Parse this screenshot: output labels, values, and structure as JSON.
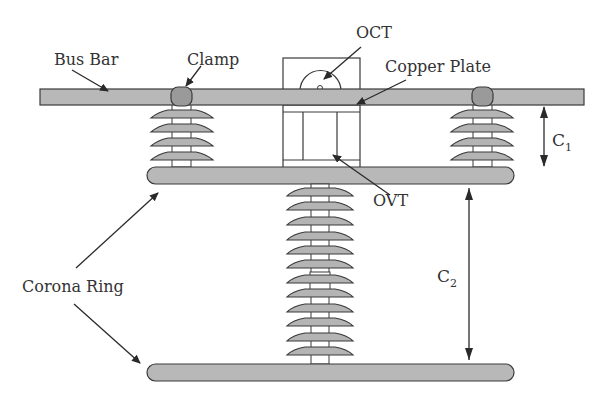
{
  "diagram": {
    "type": "substation-sensor-installation",
    "labels": {
      "bus_bar": "Bus Bar",
      "clamp": "Clamp",
      "oct": "OCT",
      "copper_plate": "Copper Plate",
      "ovt": "OVT",
      "corona_ring": "Corona Ring",
      "c1_main": "C",
      "c1_sub": "1",
      "c2_main": "C",
      "c2_sub": "2"
    },
    "components": {
      "bus_bar": {
        "x": 40,
        "y": 89,
        "w": 544,
        "h": 16
      },
      "upper_corona_ring": {
        "x": 147,
        "y": 167,
        "w": 367,
        "h": 17
      },
      "lower_corona_ring": {
        "x": 147,
        "y": 364,
        "w": 367,
        "h": 17
      },
      "left_insulator_sheds": 4,
      "right_insulator_sheds": 4,
      "center_insulator_sheds": 12,
      "clamps": [
        {
          "cx": 182
        },
        {
          "cx": 482
        }
      ]
    },
    "colors": {
      "fill_gray": "#b8b8b8",
      "clamp_gray": "#9a9a9a",
      "stroke": "#3a3a3a",
      "text": "#333333",
      "background": "#ffffff"
    }
  }
}
